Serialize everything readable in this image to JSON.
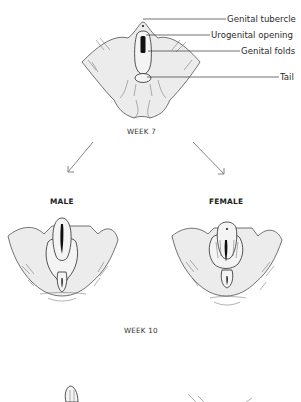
{
  "labels": {
    "genital_tubercle": "Genital tubercle",
    "urogenital_opening": "Urogenital opening",
    "genital_folds": "Genital folds",
    "tail": "Tail"
  },
  "stages": {
    "week7": "WEEK 7",
    "week10": "WEEK 10"
  },
  "branches": {
    "male": "MALE",
    "female": "FEMALE"
  }
}
